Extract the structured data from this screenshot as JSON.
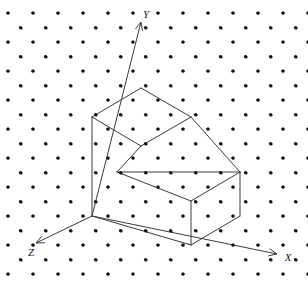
{
  "figure": {
    "name": "isometric-step-solid",
    "background_color": "#ffffff",
    "line_color": "#3a3a3a",
    "dot_color": "#111111",
    "label_color": "#1a1a1a"
  },
  "axes": {
    "origin": {
      "x": 92,
      "y": 216
    },
    "unit": {
      "dx": 25,
      "dy": 14.5,
      "dy_vertical": 29
    },
    "items": [
      {
        "id": "x",
        "label": "X",
        "label_x": 288,
        "label_y": 261,
        "tip_x": 277,
        "tip_y": 254,
        "direction": "right-down"
      },
      {
        "id": "y",
        "label": "Y",
        "label_x": 146,
        "label_y": 18,
        "tip_x": 141,
        "tip_y": 22,
        "direction": "up"
      },
      {
        "id": "z",
        "label": "Z",
        "label_x": 31,
        "label_y": 256,
        "tip_x": 36,
        "tip_y": 243,
        "direction": "left-down"
      }
    ]
  },
  "grid": {
    "type": "isometric-dot-lattice",
    "dot_radius": 1.6,
    "col_spacing": 25,
    "row_spacing": 29,
    "row_offset": 14.5,
    "x_start": 8,
    "y_start": 13
  },
  "solid": {
    "description": "two-step isometric staircase block",
    "vertices": {
      "upper_top_back": {
        "x": 141,
        "y": 88
      },
      "upper_top_left": {
        "x": 92,
        "y": 117
      },
      "upper_top_right": {
        "x": 191,
        "y": 117
      },
      "upper_top_front": {
        "x": 141,
        "y": 146
      },
      "riser_left": {
        "x": 117,
        "y": 172
      },
      "lower_top_right": {
        "x": 240,
        "y": 172
      },
      "lower_top_front": {
        "x": 191,
        "y": 201
      },
      "base_left": {
        "x": 92,
        "y": 216
      },
      "base_front": {
        "x": 191,
        "y": 245
      },
      "base_right": {
        "x": 240,
        "y": 216
      }
    },
    "edges": [
      {
        "from": "upper_top_back",
        "to": "upper_top_left"
      },
      {
        "from": "upper_top_back",
        "to": "upper_top_right"
      },
      {
        "from": "upper_top_left",
        "to": "upper_top_front"
      },
      {
        "from": "upper_top_right",
        "to": "upper_top_front"
      },
      {
        "from": "upper_top_left",
        "to": "base_left"
      },
      {
        "from": "upper_top_front",
        "to": "riser_left"
      },
      {
        "from": "upper_top_right",
        "to": "lower_top_right"
      },
      {
        "from": "riser_left",
        "to": "lower_top_right"
      },
      {
        "from": "riser_left",
        "to": "lower_top_front"
      },
      {
        "from": "lower_top_right",
        "to": "lower_top_front"
      },
      {
        "from": "lower_top_right",
        "to": "base_right"
      },
      {
        "from": "lower_top_front",
        "to": "base_front"
      },
      {
        "from": "base_left",
        "to": "base_front"
      },
      {
        "from": "base_front",
        "to": "base_right"
      }
    ]
  }
}
